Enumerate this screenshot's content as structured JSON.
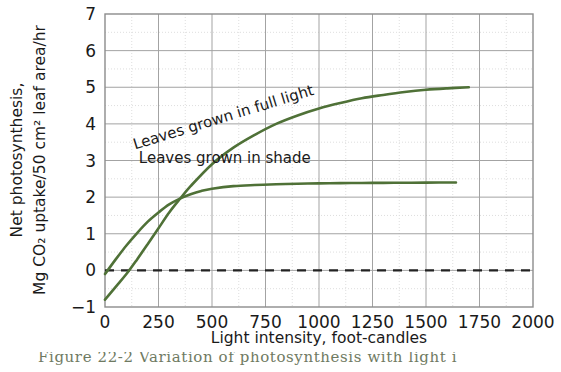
{
  "figure": {
    "caption_partial": "Figure 22-2   Variation of photosynthesis with light i"
  },
  "chart_data": {
    "type": "line",
    "title": "",
    "xlabel": "Light intensity, foot-candles",
    "ylabel_line1": "Net photosynthesis,",
    "ylabel_line2": "Mg CO₂ uptake/50 cm² leaf area/hr",
    "xlim": [
      0,
      2000
    ],
    "ylim": [
      -1,
      7
    ],
    "xticks": [
      0,
      250,
      500,
      750,
      1000,
      1250,
      1500,
      1750,
      2000
    ],
    "xtick_labels": [
      "0",
      "250",
      "500",
      "750",
      "1000",
      "1250",
      "1500",
      "1750",
      "2000"
    ],
    "yticks": [
      -1,
      0,
      1,
      2,
      3,
      4,
      5,
      6,
      7
    ],
    "ytick_labels": [
      "−1",
      "0",
      "1",
      "2",
      "3",
      "4",
      "5",
      "6",
      "7"
    ],
    "grid": true,
    "grid_major_color": "#9a9a9a",
    "grid_minor_color": "#d8d8d8",
    "legend_position": "inline-annotations",
    "series_color": "#4f7137",
    "zero_line": {
      "value": 0,
      "style": "dashed",
      "color": "#222222"
    },
    "series": [
      {
        "name": "Leaves grown in full light",
        "label": "Leaves grown in full light",
        "label_rotation": -17,
        "color": "#4f7137",
        "x": [
          0,
          50,
          100,
          150,
          200,
          250,
          300,
          350,
          400,
          500,
          600,
          700,
          800,
          900,
          1000,
          1100,
          1200,
          1300,
          1400,
          1500,
          1600,
          1700
        ],
        "y": [
          -0.8,
          -0.45,
          -0.1,
          0.3,
          0.72,
          1.15,
          1.58,
          1.95,
          2.3,
          2.9,
          3.35,
          3.7,
          4.0,
          4.23,
          4.42,
          4.57,
          4.7,
          4.79,
          4.87,
          4.93,
          4.97,
          5.0
        ]
      },
      {
        "name": "Leaves grown in shade",
        "label": "Leaves grown in shade",
        "label_rotation": 0,
        "color": "#4f7137",
        "x": [
          0,
          50,
          100,
          150,
          200,
          250,
          300,
          350,
          400,
          450,
          500,
          600,
          700,
          800,
          900,
          1000,
          1100,
          1200,
          1300,
          1400,
          1500,
          1640
        ],
        "y": [
          -0.1,
          0.3,
          0.68,
          1.02,
          1.33,
          1.58,
          1.8,
          1.96,
          2.08,
          2.17,
          2.23,
          2.3,
          2.33,
          2.35,
          2.365,
          2.375,
          2.382,
          2.387,
          2.39,
          2.393,
          2.396,
          2.4
        ]
      }
    ],
    "annotations": [
      {
        "text": "Leaves grown in full light",
        "x": 560,
        "y": 4.05
      },
      {
        "text": "Leaves grown in shade",
        "x": 560,
        "y": 2.92
      }
    ]
  }
}
